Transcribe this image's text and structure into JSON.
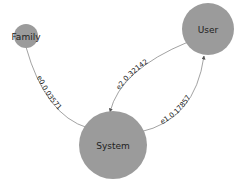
{
  "graph": {
    "nodes": [
      {
        "id": "family",
        "label": "Family",
        "color": "#9b9b9b"
      },
      {
        "id": "user",
        "label": "User",
        "color": "#9b9b9b"
      },
      {
        "id": "system",
        "label": "System",
        "color": "#9b9b9b"
      }
    ],
    "edges": [
      {
        "id": "e0",
        "from": "family",
        "to": "system",
        "label": "e0.0.03571"
      },
      {
        "id": "e2",
        "from": "user",
        "to": "system",
        "label": "e2.0.32142"
      },
      {
        "id": "e1",
        "from": "system",
        "to": "user",
        "label": "e1.0.17857"
      }
    ]
  }
}
